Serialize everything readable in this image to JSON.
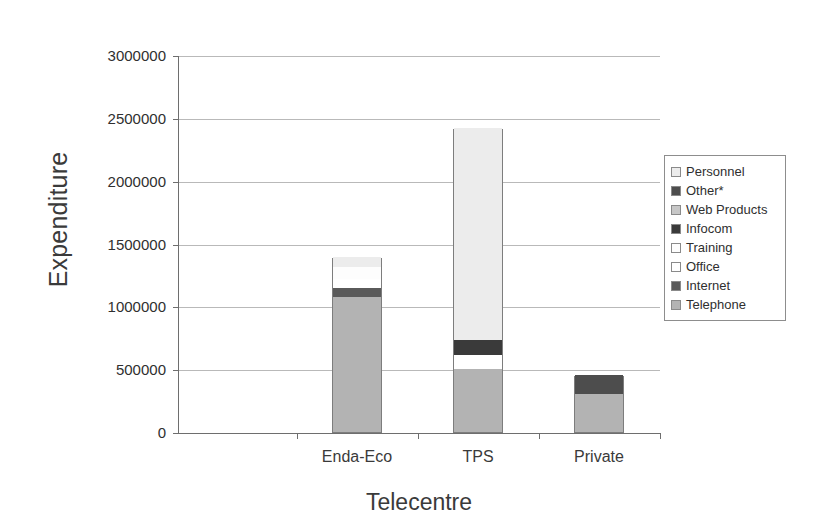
{
  "chart_data": {
    "type": "bar",
    "subtype": "stacked-column",
    "title": "",
    "xlabel": "Telecentre",
    "ylabel": "Expenditure",
    "categories": [
      "Enda-Eco",
      "TPS",
      "Private"
    ],
    "ylim": [
      0,
      3000000
    ],
    "ytick_labels": [
      "3000000",
      "2500000",
      "2000000",
      "1500000",
      "1000000",
      "500000",
      "0"
    ],
    "ytick_values": [
      3000000,
      2500000,
      2000000,
      1500000,
      1000000,
      500000,
      0
    ],
    "grid": true,
    "legend_position": "right",
    "series": [
      {
        "name": "Personnel",
        "color": "#ececec",
        "values": [
          85000,
          1690000,
          0
        ]
      },
      {
        "name": "Other*",
        "color": "#4d4d4d",
        "values": [
          0,
          0,
          150000
        ]
      },
      {
        "name": "Web Products",
        "color": "#c7c7c7",
        "values": [
          0,
          0,
          0
        ]
      },
      {
        "name": "Infocom",
        "color": "#3a3a3a",
        "values": [
          0,
          115000,
          0
        ]
      },
      {
        "name": "Training",
        "color": "#fdfdfd",
        "values": [
          95000,
          0,
          0
        ]
      },
      {
        "name": "Office",
        "color": "#ffffff",
        "values": [
          70000,
          115000,
          0
        ]
      },
      {
        "name": "Internet",
        "color": "#5a5a5a",
        "values": [
          70000,
          0,
          0
        ]
      },
      {
        "name": "Telephone",
        "color": "#b3b3b3",
        "values": [
          1075000,
          500000,
          300000
        ]
      }
    ],
    "totals": [
      1395000,
      2420000,
      450000
    ]
  },
  "legend": {
    "items": [
      {
        "label": "Personnel",
        "color": "#ececec"
      },
      {
        "label": "Other*",
        "color": "#4d4d4d"
      },
      {
        "label": "Web Products",
        "color": "#c7c7c7"
      },
      {
        "label": "Infocom",
        "color": "#3a3a3a"
      },
      {
        "label": "Training",
        "color": "#fdfdfd"
      },
      {
        "label": "Office",
        "color": "#ffffff"
      },
      {
        "label": "Internet",
        "color": "#5a5a5a"
      },
      {
        "label": "Telephone",
        "color": "#b3b3b3"
      }
    ]
  }
}
